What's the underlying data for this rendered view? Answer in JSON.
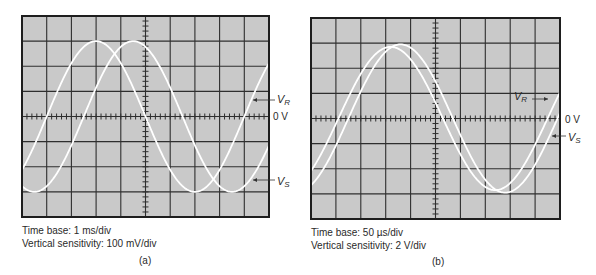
{
  "panels": [
    {
      "id": "a",
      "label": "(a)",
      "time_base": "Time base: 1 ms/div",
      "vertical_sensitivity": "Vertical sensitivity: 100 mV/div",
      "zero_label": "0 V",
      "traces": [
        {
          "name": "V",
          "sub": "R",
          "amplitude_div": 3.0,
          "period_div": 8.0,
          "zero_cross_div": 1.0
        },
        {
          "name": "V",
          "sub": "S",
          "amplitude_div": 3.0,
          "period_div": 8.0,
          "zero_cross_div": 2.5
        }
      ]
    },
    {
      "id": "b",
      "label": "(b)",
      "time_base": "Time base: 50 µs/div",
      "vertical_sensitivity": "Vertical sensitivity: 2 V/div",
      "zero_label": "0 V",
      "traces": [
        {
          "name": "V",
          "sub": "R",
          "amplitude_div": 2.85,
          "period_div": 8.4,
          "zero_cross_div": 1.1
        },
        {
          "name": "V",
          "sub": "S",
          "amplitude_div": 2.95,
          "period_div": 8.4,
          "zero_cross_div": 1.5
        }
      ]
    }
  ],
  "grid": {
    "h_divisions": 10,
    "v_divisions": 8,
    "minor_ticks_per_div": 5
  },
  "colors": {
    "screen": "#c9c9c9",
    "grid": "#2e2e2e",
    "trace": "#ffffff",
    "border": "#1e1e1e"
  }
}
